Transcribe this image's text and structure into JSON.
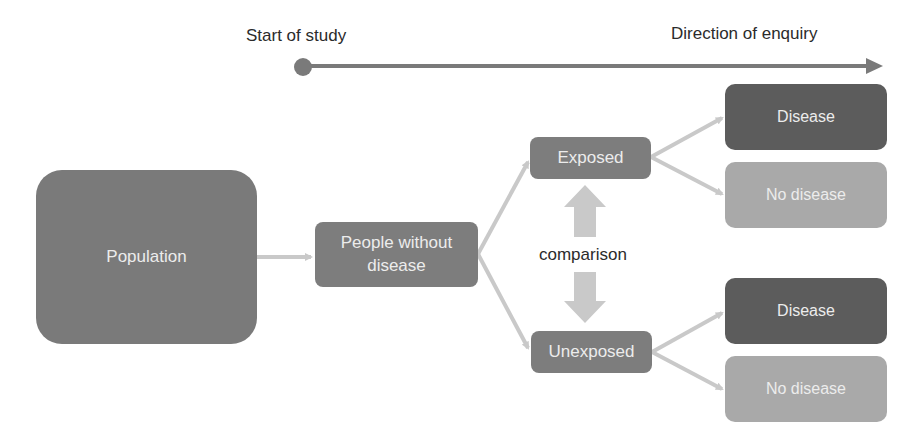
{
  "timeline": {
    "start_label": "Start of study",
    "direction_label": "Direction of enquiry",
    "line_color": "#7a7a7a"
  },
  "nodes": {
    "population": "Population",
    "people_without_disease": "People without disease",
    "exposed": "Exposed",
    "unexposed": "Unexposed",
    "exposed_outcomes": {
      "disease": "Disease",
      "no_disease": "No disease"
    },
    "unexposed_outcomes": {
      "disease": "Disease",
      "no_disease": "No disease"
    }
  },
  "comparison_label": "comparison",
  "colors": {
    "population": "#7a7a7a",
    "group": "#7d7d7d",
    "disease": "#5c5c5c",
    "no_disease": "#a9a9a9",
    "connector": "#c9c9c9"
  }
}
